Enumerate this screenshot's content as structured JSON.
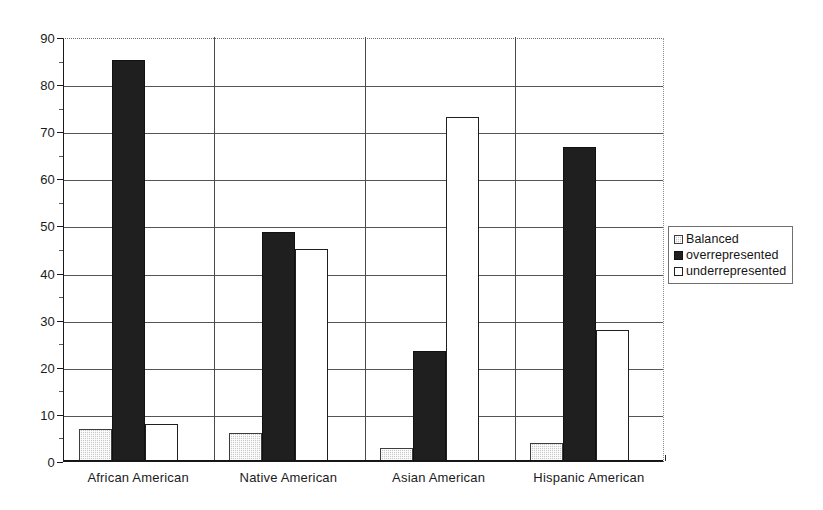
{
  "chart_data": {
    "type": "bar",
    "title": "",
    "subtitle": "",
    "xlabel": "",
    "ylabel": "",
    "categories": [
      "African American",
      "Native American",
      "Asian American",
      "Hispanic American"
    ],
    "series": [
      {
        "name": "Balanced",
        "values": [
          6.8,
          6.0,
          2.7,
          3.8
        ]
      },
      {
        "name": "overrepresented",
        "values": [
          85.2,
          48.7,
          23.3,
          66.7
        ]
      },
      {
        "name": "underrepresented",
        "values": [
          7.8,
          45.0,
          73.0,
          27.8
        ]
      }
    ],
    "ylim": [
      0,
      90
    ],
    "yticks": [
      0,
      10,
      20,
      30,
      40,
      50,
      60,
      70,
      80,
      90
    ],
    "ytick_labels": [
      "0",
      "10",
      "20",
      "30",
      "40",
      "50",
      "60",
      "70",
      "80",
      "90"
    ],
    "grid": true,
    "grid_axis": "y",
    "legend_position": "right",
    "legend_entries": [
      "Balanced",
      "overrepresented",
      "underrepresented"
    ],
    "annotations": []
  },
  "legend": {
    "items": [
      {
        "label": "Balanced",
        "style": "balanced"
      },
      {
        "label": "overrepresented",
        "style": "over"
      },
      {
        "label": "underrepresented",
        "style": "under"
      }
    ]
  }
}
